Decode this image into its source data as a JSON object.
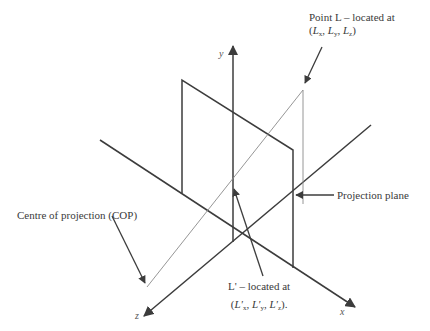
{
  "diagram": {
    "type": "perspective-projection",
    "axes": {
      "x_label": "x",
      "y_label": "y",
      "z_label": "z"
    },
    "labels": {
      "point_l_line1": "Point L – located at",
      "point_l_coords": {
        "open": "(",
        "lx": "L",
        "lx_sub": "x",
        "sep1": ", ",
        "ly": "L",
        "ly_sub": "y",
        "sep2": ", ",
        "lz": "L",
        "lz_sub": "z",
        "close": ")"
      },
      "projection_plane": "Projection plane",
      "cop": "Centre of projection (COP)",
      "point_lprime_line1": "L' – located at",
      "point_lprime_coords": {
        "open": "(",
        "lx": "L'",
        "lx_sub": "x",
        "sep1": ", ",
        "ly": "L'",
        "ly_sub": "y",
        "sep2": ", ",
        "lz": "L'",
        "lz_sub": "z",
        "close": ")."
      }
    },
    "colors": {
      "axis": "#3c3c3c",
      "plane": "#3c3c3c",
      "projector": "#8a8a8a",
      "text": "#3a3a3a",
      "background": "#ffffff"
    }
  }
}
